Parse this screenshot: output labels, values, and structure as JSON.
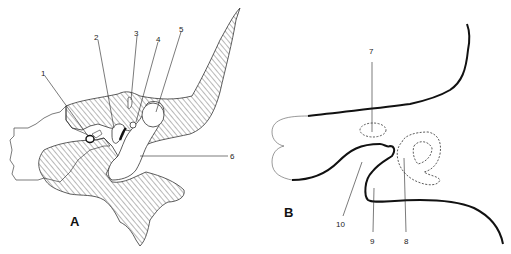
{
  "figure": {
    "panels": [
      {
        "id": "A",
        "label": "A",
        "callouts": [
          {
            "number": "1"
          },
          {
            "number": "2"
          },
          {
            "number": "3"
          },
          {
            "number": "4"
          },
          {
            "number": "5"
          },
          {
            "number": "6"
          }
        ]
      },
      {
        "id": "B",
        "label": "B",
        "callouts": [
          {
            "number": "7"
          },
          {
            "number": "8"
          },
          {
            "number": "9"
          },
          {
            "number": "10"
          }
        ]
      }
    ]
  }
}
